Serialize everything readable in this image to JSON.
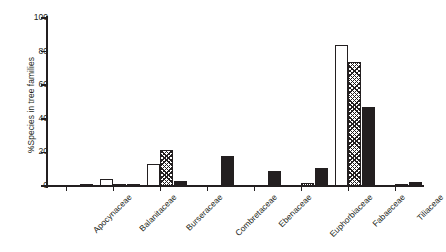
{
  "chart_data": {
    "type": "bar",
    "title": "",
    "xlabel": "",
    "ylabel": "%Species in tree families",
    "ylim": [
      0,
      100
    ],
    "yticks": [
      0,
      20,
      40,
      60,
      80,
      100
    ],
    "grid": false,
    "legend": "none",
    "categories": [
      "Apocynaceae",
      "Balanitaceae",
      "Burseraceae",
      "Combretaceae",
      "Ebenaceae",
      "Euphorbiaceae",
      "Fabaeceae",
      "Tiliaceae"
    ],
    "series": [
      {
        "name": "open",
        "pattern": "white-fill",
        "values": [
          0,
          4,
          13,
          0,
          0,
          0,
          84,
          0
        ]
      },
      {
        "name": "hatched",
        "pattern": "cross-hatch",
        "values": [
          0,
          1,
          21.5,
          0,
          0,
          2,
          74,
          1
        ]
      },
      {
        "name": "solid",
        "pattern": "black-fill",
        "values": [
          1,
          0.5,
          3,
          18,
          9,
          11,
          47,
          2.5
        ]
      }
    ]
  },
  "axis": {
    "tick_labels": [
      "100",
      "80",
      "60",
      "40",
      "20",
      "0"
    ],
    "y_title": "%Species in tree families"
  },
  "colors": {
    "ink": "#231f20",
    "background": "#ffffff"
  }
}
